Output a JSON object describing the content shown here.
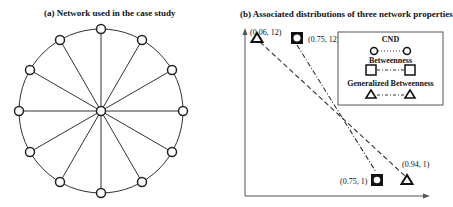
{
  "panel_a": {
    "title": "(a) Network used in the case study",
    "network": {
      "type": "wheel",
      "rim_nodes": 12,
      "hub_nodes": 1
    }
  },
  "panel_b": {
    "title": "(b) Associated distributions of three network properties",
    "points": [
      {
        "label": "(0.06, 12)",
        "marker": "triangle",
        "series": "Generalized Betweenness"
      },
      {
        "label": "(0.75, 12)",
        "marker": "square-circle",
        "series": "CND / Betweenness"
      },
      {
        "label": "(0.75, 1)",
        "marker": "square-circle",
        "series": "CND / Betweenness"
      },
      {
        "label": "(0.94, 1)",
        "marker": "triangle",
        "series": "Generalized Betweenness"
      }
    ],
    "legend": {
      "items": [
        {
          "label": "CND",
          "marker": "circle",
          "line": "dotted"
        },
        {
          "label": "Betweenness",
          "marker": "square",
          "line": "dash-dot"
        },
        {
          "label": "Generalized Betweenness",
          "marker": "triangle",
          "line": "dash-dot"
        }
      ]
    }
  },
  "colors": {
    "stroke": "#222222",
    "background": "#ffffff"
  }
}
